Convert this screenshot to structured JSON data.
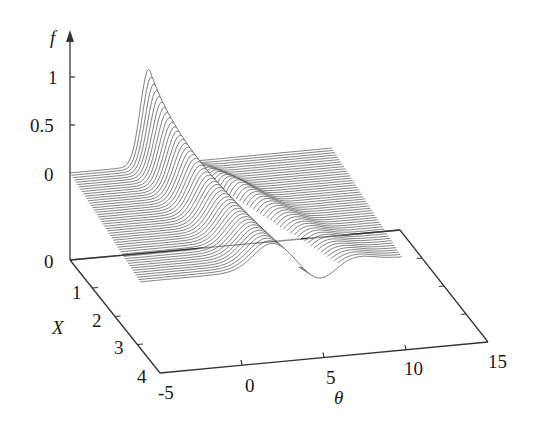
{
  "chart_data": {
    "type": "surface3d",
    "title": "",
    "xlabel": "θ",
    "ylabel": "X",
    "zlabel": "f",
    "theta_ticks": [
      "-5",
      "0",
      "5",
      "10",
      "15"
    ],
    "theta_tick_values": [
      -5,
      0,
      5,
      10,
      15
    ],
    "x_ticks": [
      "0",
      "1",
      "2",
      "3",
      "4"
    ],
    "x_tick_values": [
      0,
      1,
      2,
      3,
      4
    ],
    "f_ticks": [
      "0",
      "0.5",
      "1"
    ],
    "f_tick_values": [
      0,
      0.5,
      1
    ],
    "theta_range": [
      -5,
      15
    ],
    "x_range": [
      0,
      4
    ],
    "surface_x_range": [
      0,
      3
    ],
    "f_range": [
      0,
      1.1
    ],
    "num_curves": 48,
    "grid": false,
    "series": [
      {
        "name": "X=0",
        "theta": [
          -5,
          -2,
          0,
          1,
          2,
          4,
          6,
          10,
          15
        ],
        "f": [
          0,
          0.05,
          0.55,
          1.0,
          0.55,
          0.05,
          0.0,
          0.0,
          0.0
        ]
      },
      {
        "name": "X=1",
        "theta": [
          -5,
          -2,
          0,
          1,
          2,
          3,
          4,
          6,
          10,
          15
        ],
        "f": [
          0,
          0.0,
          0.25,
          0.45,
          0.35,
          0.05,
          -0.2,
          -0.05,
          0.0,
          0.0
        ]
      },
      {
        "name": "X=2",
        "theta": [
          -5,
          -2,
          0,
          2,
          3,
          4,
          5,
          7,
          10,
          15
        ],
        "f": [
          0,
          0.0,
          0.05,
          0.25,
          0.3,
          0.05,
          -0.25,
          -0.1,
          0.02,
          0.0
        ]
      },
      {
        "name": "X=3",
        "theta": [
          -5,
          0,
          2,
          4,
          5,
          6,
          7,
          9,
          12,
          15
        ],
        "f": [
          0,
          0.0,
          0.05,
          0.2,
          0.22,
          0.0,
          -0.2,
          -0.08,
          0.02,
          0.0
        ]
      }
    ]
  },
  "labels": {
    "f_axis": "f",
    "x_axis": "X",
    "theta_axis": "θ",
    "f_tick_0": "0",
    "f_tick_05": "0.5",
    "f_tick_1": "1",
    "floor_zero": "0",
    "x_tick_1": "1",
    "x_tick_2": "2",
    "x_tick_3": "3",
    "x_tick_4": "4",
    "theta_tick_m5": "-5",
    "theta_tick_0": "0",
    "theta_tick_5": "5",
    "theta_tick_10": "10",
    "theta_tick_15": "15"
  }
}
